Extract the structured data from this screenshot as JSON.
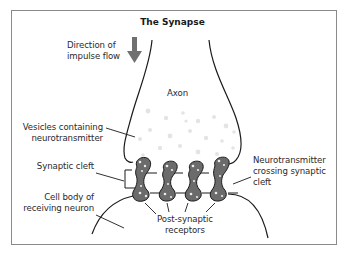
{
  "title": "The Synapse",
  "labels": {
    "direction": [
      "Direction of",
      "impulse flow"
    ],
    "axon": "Axon",
    "vesicles": [
      "Vesicles containing",
      "neurotransmitter"
    ],
    "synaptic_cleft": "Synaptic cleft",
    "cell_body": [
      "Cell body of",
      "receiving neuron"
    ],
    "neurotransmitter_crossing": [
      "Neurotransmitter",
      "crossing synaptic",
      "cleft"
    ],
    "post_synaptic": [
      "Post-synaptic",
      "receptors"
    ]
  },
  "icons": {
    "direction_arrow": "down-arrow-icon"
  },
  "colors": {
    "frame": "#8a8a8a",
    "outline": "#1a1a1a",
    "receptor_fill": "#6b6b6b",
    "arrow": "#707070",
    "vesicle_dots": "#e6e6e6"
  }
}
